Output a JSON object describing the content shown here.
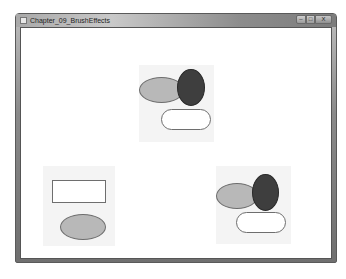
{
  "window": {
    "title": "Chapter_09_BrushEffects",
    "controls": {
      "minimize": "–",
      "maximize": "□",
      "close": "X"
    }
  },
  "colors": {
    "light_ellipse": "#b8b8b8",
    "dark_ellipse": "#3e3e3e",
    "white_fill": "#ffffff",
    "outline": "#6e6e6e",
    "panel_bg": "#f4f4f4"
  },
  "canvas": {
    "groups": [
      {
        "name": "top-center-group",
        "shapes": [
          {
            "type": "ellipse",
            "fill": "light-gray"
          },
          {
            "type": "ellipse",
            "fill": "dark-gray"
          },
          {
            "type": "rounded-rect",
            "fill": "white"
          }
        ]
      },
      {
        "name": "bottom-left-group",
        "shapes": [
          {
            "type": "rectangle",
            "fill": "white"
          },
          {
            "type": "ellipse",
            "fill": "light-gray"
          }
        ]
      },
      {
        "name": "bottom-right-group",
        "shapes": [
          {
            "type": "ellipse",
            "fill": "light-gray"
          },
          {
            "type": "ellipse",
            "fill": "dark-gray"
          },
          {
            "type": "rounded-rect",
            "fill": "white"
          }
        ]
      }
    ]
  }
}
